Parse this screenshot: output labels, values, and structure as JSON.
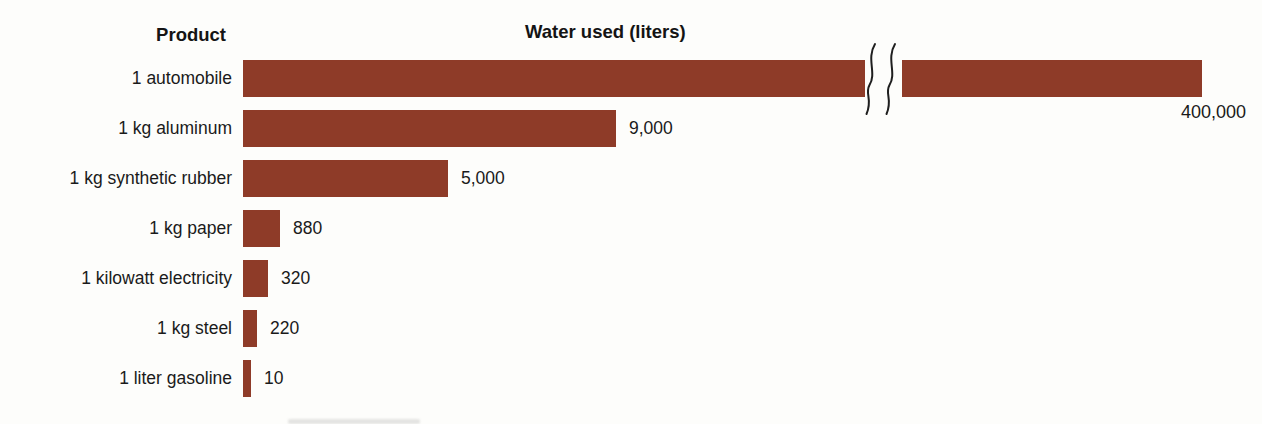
{
  "chart_data": {
    "type": "bar",
    "orientation": "horizontal",
    "unit": "liters",
    "col_headers": {
      "product": "Product",
      "value": "Water used (liters)"
    },
    "rows": [
      {
        "label": "1 automobile",
        "value": 400000,
        "value_label": "400,000",
        "broken": true
      },
      {
        "label": "1 kg aluminum",
        "value": 9000,
        "value_label": "9,000"
      },
      {
        "label": "1 kg synthetic rubber",
        "value": 5000,
        "value_label": "5,000"
      },
      {
        "label": "1 kg paper",
        "value": 880,
        "value_label": "880"
      },
      {
        "label": "1 kilowatt electricity",
        "value": 320,
        "value_label": "320"
      },
      {
        "label": "1 kg steel",
        "value": 220,
        "value_label": "220"
      },
      {
        "label": "1 liter gasoline",
        "value": 10,
        "value_label": "10"
      }
    ],
    "bar_color": "#8E3B28",
    "axis_break": {
      "present": true,
      "on_row": "1 automobile",
      "style": "double-squiggle"
    },
    "layout": {
      "bar_left_px": 243,
      "bar_height_px": 37,
      "row_pitch_px": 50,
      "first_row_top_px": 60,
      "bar_px": [
        959,
        373,
        205,
        37,
        25,
        14,
        8
      ],
      "break_seg1_px": 622,
      "break_gap_left_px": 865,
      "break_seg2_left_px": 902,
      "break_seg2_px": 300,
      "value_gap_px": 13,
      "broken_value_right_px": 1246
    }
  }
}
